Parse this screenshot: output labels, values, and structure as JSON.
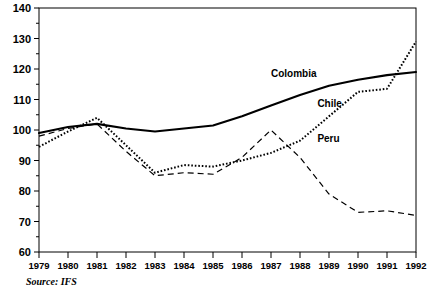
{
  "source_note": "Source: IFS",
  "axes": {
    "y_tick_labels": [
      "140",
      "130",
      "120",
      "110",
      "100",
      "90",
      "80",
      "70",
      "60"
    ],
    "x_tick_labels": [
      "1979",
      "1980",
      "1981",
      "1982",
      "1983",
      "1984",
      "1985",
      "1986",
      "1987",
      "1988",
      "1989",
      "1990",
      "1991",
      "1992"
    ]
  },
  "series_labels": {
    "colombia": "Colombia",
    "chile": "Chile",
    "peru": "Peru"
  },
  "colors": {
    "ink": "#000000",
    "background": "#ffffff"
  },
  "chart_data": {
    "type": "line",
    "title": "",
    "subtitle": "",
    "xlabel": "",
    "ylabel": "",
    "xlim": [
      1979,
      1992
    ],
    "ylim": [
      60,
      140
    ],
    "y_major_step": 10,
    "y_minor_step": 5,
    "grid": false,
    "legend": "inline-annotations",
    "x": [
      1979,
      1980,
      1981,
      1982,
      1983,
      1984,
      1985,
      1986,
      1987,
      1988,
      1989,
      1990,
      1991,
      1992
    ],
    "series": [
      {
        "name": "Colombia",
        "style": "solid",
        "label_position": {
          "x": 1987.0,
          "y": 117.5
        },
        "values": [
          99.0,
          101.0,
          102.0,
          100.5,
          99.5,
          100.5,
          101.5,
          104.5,
          108.0,
          111.5,
          114.5,
          116.5,
          118.0,
          119.0
        ]
      },
      {
        "name": "Chile",
        "style": "dotted",
        "label_position": {
          "x": 1988.6,
          "y": 107.5
        },
        "values": [
          94.5,
          99.5,
          104.0,
          95.0,
          86.0,
          88.5,
          88.0,
          90.0,
          92.5,
          96.5,
          104.5,
          112.5,
          113.5,
          129.0
        ]
      },
      {
        "name": "Peru",
        "style": "dashed",
        "label_position": {
          "x": 1988.6,
          "y": 96.0
        },
        "values": [
          98.0,
          100.5,
          102.0,
          93.0,
          85.0,
          86.0,
          85.5,
          91.0,
          100.0,
          91.0,
          79.0,
          73.0,
          73.5,
          72.0
        ]
      }
    ]
  }
}
